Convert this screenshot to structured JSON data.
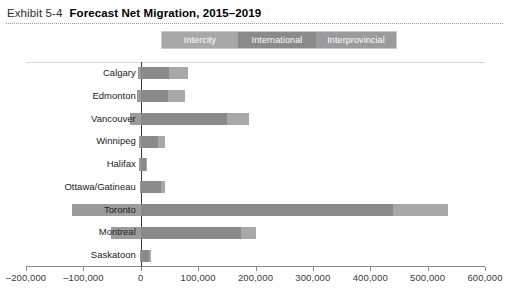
{
  "header": {
    "exhibit_label": "Exhibit 5-4",
    "title": "Forecast Net Migration, 2015–2019"
  },
  "colors": {
    "intercity": "#a8a8a8",
    "international": "#8a8a8a",
    "interprovincial": "#9b9b9b",
    "axis": "#8c8c8c",
    "zero_line": "#3b3b3b",
    "text": "#222222"
  },
  "legend": {
    "position": "top-center",
    "items": [
      {
        "label": "Intercity",
        "color": "#a8a8a8",
        "width": 76
      },
      {
        "label": "International",
        "color": "#8a8a8a",
        "width": 78
      },
      {
        "label": "Interprovincial",
        "color": "#9b9b9b",
        "width": 80
      }
    ]
  },
  "chart_data": {
    "type": "bar",
    "orientation": "horizontal",
    "stacked": true,
    "title": "Forecast Net Migration, 2015–2019",
    "xlabel": "",
    "ylabel": "",
    "xlim": [
      -200000,
      600000
    ],
    "xticks": [
      -200000,
      -100000,
      0,
      100000,
      200000,
      300000,
      400000,
      500000,
      600000
    ],
    "xticklabels": [
      "–200,000",
      "–100,000",
      "0",
      "100,000",
      "200,000",
      "300,000",
      "400,000",
      "500,000",
      "600,000"
    ],
    "grid": false,
    "categories": [
      "Calgary",
      "Edmonton",
      "Vancouver",
      "Winnipeg",
      "Halifax",
      "Ottawa/Gatineau",
      "Toronto",
      "Montreal",
      "Saskatoon"
    ],
    "series": [
      {
        "name": "Interprovincial",
        "color": "#9b9b9b",
        "values": [
          -4000,
          -7000,
          -18000,
          -3000,
          -3000,
          -2000,
          -120000,
          -52000,
          -2000
        ]
      },
      {
        "name": "International",
        "color": "#8a8a8a",
        "values": [
          50000,
          48000,
          150000,
          30000,
          9000,
          35000,
          440000,
          175000,
          14000
        ]
      },
      {
        "name": "Intercity",
        "color": "#a8a8a8",
        "values": [
          33000,
          30000,
          38000,
          12000,
          1000,
          8000,
          95000,
          25000,
          4000
        ]
      }
    ],
    "totals": [
      83000,
      78000,
      188000,
      42000,
      10000,
      43000,
      535000,
      200000,
      18000
    ]
  }
}
